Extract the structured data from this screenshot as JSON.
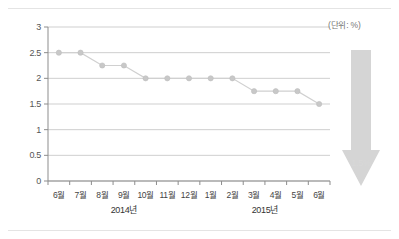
{
  "annotation": {
    "unit_note": "(단위: %)",
    "arrow_label": "1.5%"
  },
  "axis": {
    "y_ticks": [
      "0",
      "0.5",
      "1",
      "1.5",
      "2",
      "2.5",
      "3"
    ],
    "x_ticks": [
      "6월",
      "7월",
      "8월",
      "9월",
      "10월",
      "11월",
      "12월",
      "1월",
      "2월",
      "3월",
      "4월",
      "5월",
      "6월"
    ],
    "year_groups": [
      "2014년",
      "2015년"
    ]
  },
  "colors": {
    "line": "#d0d0d0",
    "marker": "#c8c8c8",
    "grid": "#c9c9c9",
    "axis": "#8d8d8d",
    "arrow": "#d5d5d5",
    "frame": "#e4e4e4",
    "text": "#444444"
  },
  "chart_data": {
    "type": "line",
    "title": "",
    "subtitle": "",
    "xlabel": "",
    "ylabel": "",
    "unit": "%",
    "categories": [
      "6월",
      "7월",
      "8월",
      "9월",
      "10월",
      "11월",
      "12월",
      "1월",
      "2월",
      "3월",
      "4월",
      "5월",
      "6월"
    ],
    "category_years": [
      "2014년",
      "2014년",
      "2014년",
      "2014년",
      "2014년",
      "2014년",
      "2014년",
      "2015년",
      "2015년",
      "2015년",
      "2015년",
      "2015년",
      "2015년"
    ],
    "values": [
      2.5,
      2.5,
      2.25,
      2.25,
      2.0,
      2.0,
      2.0,
      2.0,
      2.0,
      1.75,
      1.75,
      1.75,
      1.5
    ],
    "ylim": [
      0,
      3
    ],
    "ytick_values": [
      0,
      0.5,
      1,
      1.5,
      2,
      2.5,
      3
    ],
    "grid": true,
    "legend": "none",
    "markers": true,
    "annotations": [
      {
        "text": "(단위: %)",
        "position": "top-right"
      },
      {
        "text": "1.5%",
        "position": "arrow-down-right",
        "shape": "down-arrow"
      }
    ]
  }
}
